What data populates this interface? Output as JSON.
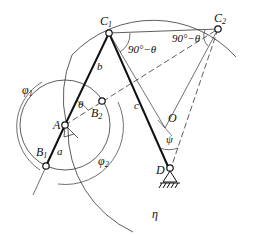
{
  "diagram": {
    "points": {
      "C1": {
        "label": "C",
        "sub": "1"
      },
      "C2": {
        "label": "C",
        "sub": "2"
      },
      "A": {
        "label": "A"
      },
      "B1": {
        "label": "B",
        "sub": "1"
      },
      "B2": {
        "label": "B",
        "sub": "2"
      },
      "D": {
        "label": "D"
      },
      "O": {
        "label": "O"
      }
    },
    "links": {
      "a": "a",
      "b": "b",
      "c": "c"
    },
    "angles": {
      "theta": "θ",
      "psi": "ψ",
      "angle_c1": "90°−θ",
      "angle_c2": "90°−θ",
      "phi1": {
        "label": "φ",
        "sub": "1"
      },
      "phi2": {
        "label": "φ",
        "sub": "2"
      }
    },
    "circle_label": "η"
  }
}
